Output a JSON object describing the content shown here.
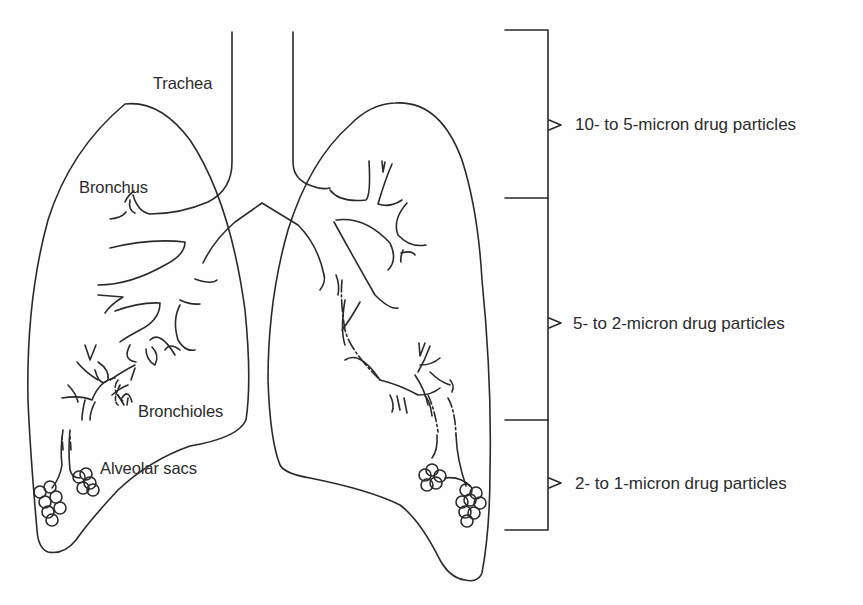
{
  "diagram": {
    "stroke_color": "#2a2a2a",
    "background": "#fefefe",
    "anatomy_labels": [
      {
        "id": "trachea",
        "text": "Trachea"
      },
      {
        "id": "bronchus",
        "text": "Bronchus"
      },
      {
        "id": "bronchioles",
        "text": "Bronchioles"
      },
      {
        "id": "alveolar_sacs",
        "text": "Alveolar sacs"
      }
    ],
    "deposition_ranges": [
      {
        "id": "upper",
        "text": "10- to 5-micron drug particles",
        "region": "Trachea / Bronchus"
      },
      {
        "id": "middle",
        "text": "5- to 2-micron drug particles",
        "region": "Bronchi / Bronchioles"
      },
      {
        "id": "lower",
        "text": "2- to 1-micron drug particles",
        "region": "Alveolar sacs"
      }
    ],
    "bracket": {
      "tick_y": [
        30,
        198,
        420,
        530
      ],
      "arrow_marker": "open-triangle"
    }
  }
}
